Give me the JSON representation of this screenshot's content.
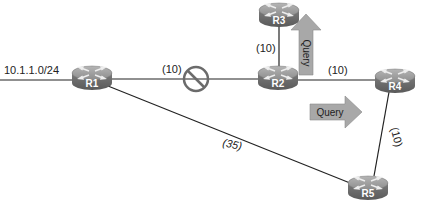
{
  "diagram": {
    "network_label": "10.1.1.0/24",
    "routers": [
      {
        "id": "R1",
        "label": "R1",
        "x": 92,
        "y": 77
      },
      {
        "id": "R2",
        "label": "R2",
        "x": 278,
        "y": 77
      },
      {
        "id": "R3",
        "label": "R3",
        "x": 279,
        "y": 14
      },
      {
        "id": "R4",
        "label": "R4",
        "x": 395,
        "y": 80
      },
      {
        "id": "R5",
        "label": "R5",
        "x": 368,
        "y": 187
      }
    ],
    "links": [
      {
        "from": "R1",
        "to": "R2",
        "metric": "(10)",
        "blocked": true
      },
      {
        "from": "R2",
        "to": "R3",
        "metric": "(10)"
      },
      {
        "from": "R2",
        "to": "R4",
        "metric": "(10)"
      },
      {
        "from": "R4",
        "to": "R5",
        "metric": "(10)"
      },
      {
        "from": "R1",
        "to": "R5",
        "metric": "(35)"
      }
    ],
    "arrows": [
      {
        "label": "Query",
        "direction": "up",
        "near": "R2-R3"
      },
      {
        "label": "Query",
        "direction": "right",
        "near": "R2-R4"
      }
    ],
    "colors": {
      "router_top": "#9a9a9a",
      "router_side": "#6f6f6f",
      "arrow_fill": "#a8a8a8",
      "blocked_symbol": "#6b6b6b",
      "line": "#222222"
    }
  }
}
